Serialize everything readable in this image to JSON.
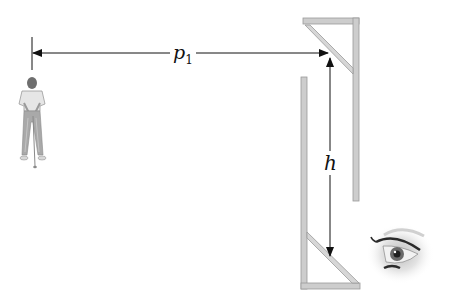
{
  "diagram": {
    "type": "periscope",
    "labels": {
      "horizontal_distance": "p",
      "horizontal_distance_subscript": "1",
      "vertical_height": "h"
    },
    "elements": [
      {
        "name": "golfer",
        "description": "golfer standing with club, target viewed through periscope"
      },
      {
        "name": "upper-mirror",
        "description": "45-degree mirror at top of periscope"
      },
      {
        "name": "lower-mirror",
        "description": "45-degree mirror at bottom of periscope"
      },
      {
        "name": "eye",
        "description": "observer eye at lower right looking into periscope"
      }
    ],
    "colors": {
      "frame": "#c8c8c8",
      "frame_edge": "#9a9a9a",
      "line": "#111111",
      "background": "#ffffff"
    }
  }
}
